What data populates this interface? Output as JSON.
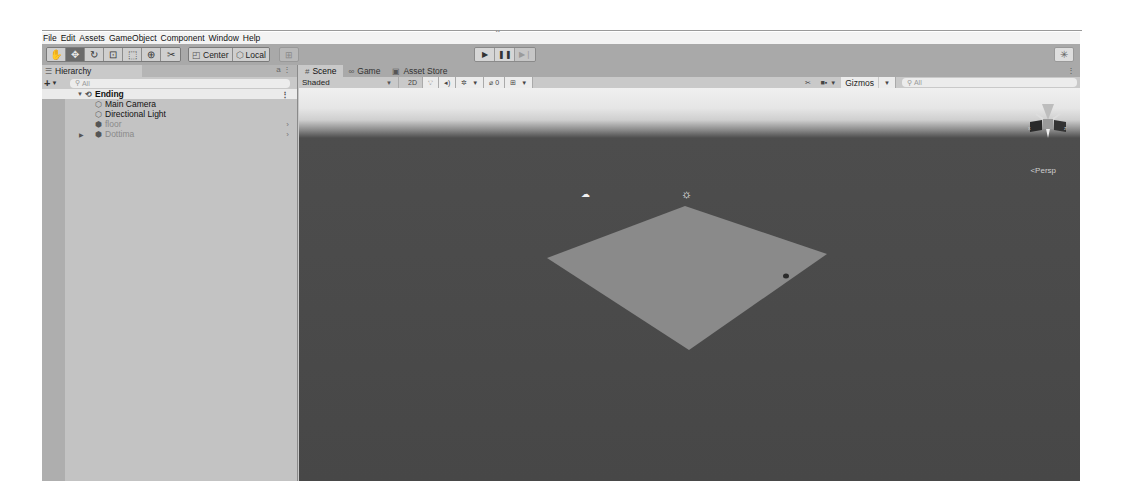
{
  "menu": [
    "File",
    "Edit",
    "Assets",
    "GameObject",
    "Component",
    "Window",
    "Help"
  ],
  "toolbar": {
    "tools": [
      {
        "name": "hand-tool",
        "glyph": "✋",
        "active": false
      },
      {
        "name": "move-tool",
        "glyph": "✥",
        "active": true
      },
      {
        "name": "rotate-tool",
        "glyph": "↻",
        "active": false
      },
      {
        "name": "scale-tool",
        "glyph": "⊡",
        "active": false
      },
      {
        "name": "rect-tool",
        "glyph": "⬚",
        "active": false
      },
      {
        "name": "transform-tool",
        "glyph": "⊕",
        "active": false
      },
      {
        "name": "custom-tool",
        "glyph": "✂",
        "active": false
      }
    ],
    "pivot_label": "Center",
    "rotation_label": "Local",
    "play_label": "▶",
    "pause_label": "❚❚",
    "step_label": "▶❘"
  },
  "hierarchy": {
    "tab_label": "Hierarchy",
    "search_placeholder": "All",
    "scene": "Ending",
    "items": [
      {
        "label": "Main Camera",
        "icon": "cube-outline",
        "active": true,
        "has_children": false
      },
      {
        "label": "Directional Light",
        "icon": "cube-outline",
        "active": true,
        "has_children": false
      },
      {
        "label": "floor",
        "icon": "prefab",
        "active": false,
        "has_children": false
      },
      {
        "label": "Dottima",
        "icon": "prefab",
        "active": false,
        "has_children": true
      }
    ]
  },
  "scene_view": {
    "tabs": [
      {
        "label": "Scene",
        "icon": "#",
        "active": true
      },
      {
        "label": "Game",
        "icon": "∞",
        "active": false
      },
      {
        "label": "Asset Store",
        "icon": "▣",
        "active": false
      }
    ],
    "shading_mode": "Shaded",
    "toggle_2d": "2D",
    "hidden_count": "0",
    "gizmos_label": "Gizmos",
    "search_placeholder": "All",
    "projection_label": "Persp"
  },
  "colors": {
    "window_bg": "#c8c8c8",
    "toolbar_bg": "#a9a9a9",
    "viewport_sky": "#f0f0f0",
    "viewport_ground": "#474747",
    "floor_plane": "#8a8a8a"
  }
}
